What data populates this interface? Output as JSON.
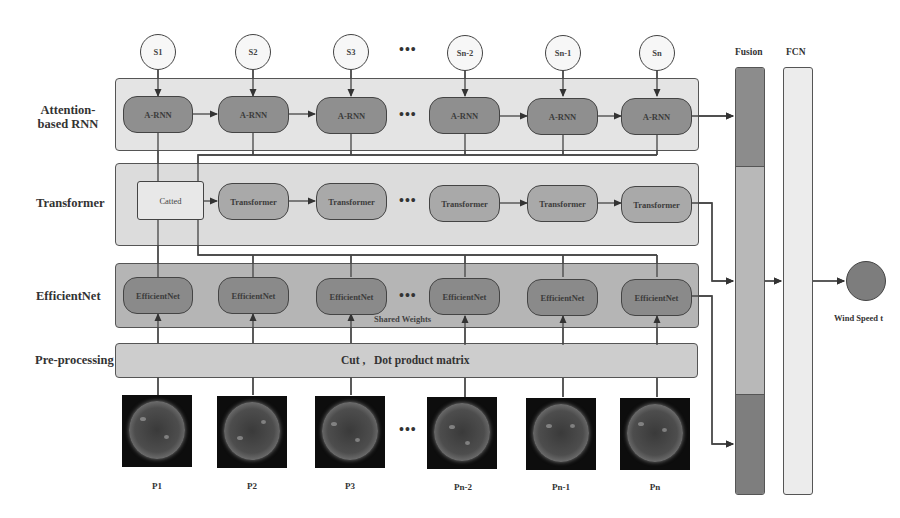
{
  "diagram": {
    "row_labels": {
      "rnn": [
        "Attention-",
        "based RNN"
      ],
      "transformer": "Transformer",
      "efficientnet": "EfficientNet",
      "preprocessing": "Pre-processing"
    },
    "inputs_s": [
      "S1",
      "S2",
      "S3",
      "Sn-2",
      "Sn-1",
      "Sn"
    ],
    "ellipsis": "•••",
    "rnn_nodes": [
      "A-RNN",
      "A-RNN",
      "A-RNN",
      "A-RNN",
      "A-RNN",
      "A-RNN"
    ],
    "catted_label": "Catted",
    "transformer_nodes": [
      "Transformer",
      "Transformer",
      "Transformer",
      "Transformer",
      "Transformer"
    ],
    "efficientnet_nodes": [
      "EfficientNet",
      "EfficientNet",
      "EfficientNet",
      "EfficientNet",
      "EfficientNet",
      "EfficientNet"
    ],
    "shared_weights_label": "Shared Weights",
    "preprocessing_text": "Cut ,   Dot product matrix",
    "image_labels": [
      "P1",
      "P2",
      "P3",
      "Pn-2",
      "Pn-1",
      "Pn"
    ],
    "fusion_title": "Fusion",
    "fcn_title": "FCN",
    "output_label": "Wind Speed t",
    "colors": {
      "rnn_band": "#e4e4e4",
      "transformer_band": "#dcdcdc",
      "efficientnet_band": "#b5b5b5",
      "preprocessing_band": "#cdcdcd",
      "fusion_dark": "#8c8c8c",
      "fusion_light": "#b8b8b8",
      "fcn": "#ececec",
      "output_node": "#7d7d7d"
    }
  }
}
